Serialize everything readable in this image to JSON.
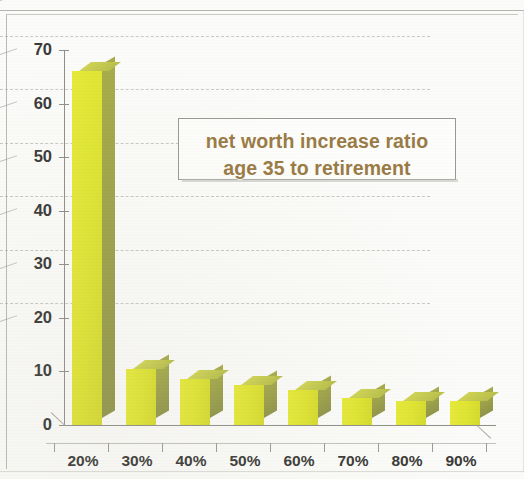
{
  "chart_data": {
    "type": "bar",
    "title": "",
    "annotation": {
      "line1": "net worth increase ratio",
      "line2": "age 35 to retirement",
      "text_color": "#9a7b45",
      "box_background": "#fdfdfb",
      "box_border": "#9a9a95"
    },
    "categories": [
      "20%",
      "30%",
      "40%",
      "50%",
      "60%",
      "70%",
      "80%",
      "90%"
    ],
    "values": [
      66,
      10.5,
      8.5,
      7.5,
      6.5,
      5,
      4.5,
      4.5
    ],
    "series": [
      {
        "name": "net worth increase ratio",
        "values": [
          66,
          10.5,
          8.5,
          7.5,
          6.5,
          5,
          4.5,
          4.5
        ]
      }
    ],
    "xlabel": "",
    "ylabel": "",
    "ylim": [
      0,
      70
    ],
    "ytick_labels": [
      "0",
      "10",
      "20",
      "30",
      "40",
      "50",
      "60",
      "70"
    ],
    "ytick_values": [
      0,
      10,
      20,
      30,
      40,
      50,
      60,
      70
    ],
    "grid": true,
    "grid_axis": "y",
    "legend": false,
    "legend_position": "none",
    "style": "3d-column",
    "bar_face_color": "#dfe433",
    "bar_side_color": "#95994a",
    "bar_top_color": "#c4c950",
    "axis_color": "#8f8f8a",
    "background_color": "#fbfbf9"
  }
}
